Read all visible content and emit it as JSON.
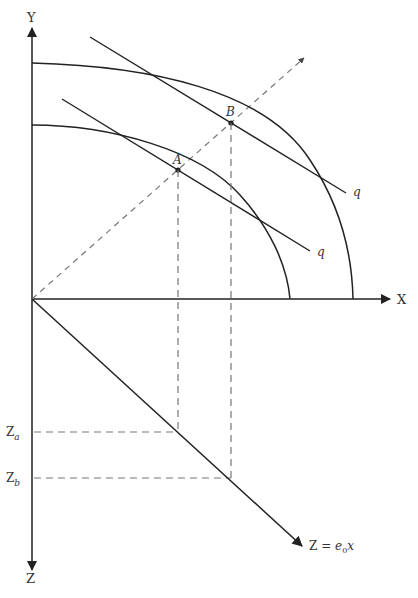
{
  "diagram": {
    "type": "production-possibility / transformation curves with emissions quadrant",
    "axes": {
      "y_label": "Y",
      "x_label": "X",
      "z_label": "Z"
    },
    "points": {
      "a_label": "A",
      "b_label": "B"
    },
    "tangent_labels": {
      "upper": "q",
      "lower": "q"
    },
    "z_levels": {
      "za_base": "Z",
      "za_sub": "a",
      "zb_base": "Z",
      "zb_sub": "b"
    },
    "emission_line": {
      "lhs": "Z = ",
      "coef": "e",
      "coef_sub": "0",
      "var": "x"
    },
    "colors": {
      "line": "#222222",
      "dashed": "#777777",
      "text": "#333333"
    }
  }
}
